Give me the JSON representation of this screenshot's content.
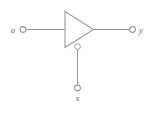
{
  "diagram": {
    "type": "logic-gate-schematic",
    "width": 155,
    "height": 114,
    "background_color": "#ffffff",
    "line_color": "#9a9a9a",
    "label_color": "#5f5f5f"
  },
  "gate": {
    "symbol": "buffer-triangle",
    "has_enable_bubble": true,
    "bubble_semantics": "active-low-enable"
  },
  "ports": {
    "input": {
      "name": "a",
      "label": "a",
      "side": "left",
      "terminal": "open-circle"
    },
    "output": {
      "name": "y",
      "label": "y",
      "side": "right",
      "terminal": "open-circle"
    },
    "enable": {
      "name": "s",
      "label": "s",
      "side": "bottom",
      "terminal": "open-circle"
    }
  },
  "nets": [
    {
      "name": "input-wire",
      "from": "a",
      "to": "gate-input"
    },
    {
      "name": "output-wire",
      "from": "gate-output",
      "to": "y"
    },
    {
      "name": "enable-wire",
      "from": "s",
      "to": "gate-enable-bubble"
    }
  ]
}
